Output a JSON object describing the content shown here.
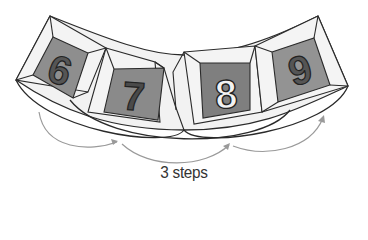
{
  "diagram": {
    "tiles": [
      {
        "label": "6",
        "face_color": "#8e8e8e",
        "digit_color": "#555555"
      },
      {
        "label": "7",
        "face_color": "#8a8a8a",
        "digit_color": "#4a4a4a"
      },
      {
        "label": "8",
        "face_color": "#7f7f7f",
        "digit_color": "#f2f2f2"
      },
      {
        "label": "9",
        "face_color": "#939393",
        "digit_color": "#555555"
      }
    ],
    "arrows": [
      {
        "from": "6",
        "to": "7"
      },
      {
        "from": "7",
        "to": "8"
      },
      {
        "from": "8",
        "to": "9"
      }
    ],
    "caption": "3 steps",
    "colors": {
      "outline": "#2a2a2a",
      "bevel": "#f0f0f0",
      "arrow": "#9a9a9a"
    }
  }
}
